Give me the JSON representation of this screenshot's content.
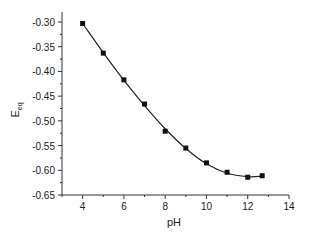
{
  "chart_data": {
    "type": "line",
    "title": "",
    "xlabel": "pH",
    "ylabel": "E",
    "ylabel_subscript": "eq",
    "xlim": [
      3,
      14
    ],
    "ylim": [
      -0.65,
      -0.28
    ],
    "xticks": [
      4,
      6,
      8,
      10,
      12,
      14
    ],
    "xtick_labels": [
      "4",
      "6",
      "8",
      "10",
      "12",
      "14"
    ],
    "yticks": [
      -0.3,
      -0.35,
      -0.4,
      -0.45,
      -0.5,
      -0.55,
      -0.6,
      -0.65
    ],
    "ytick_labels": [
      "-0.30",
      "-0.35",
      "-0.40",
      "-0.45",
      "-0.50",
      "-0.55",
      "-0.60",
      "-0.65"
    ],
    "grid": false,
    "legend": null,
    "series": [
      {
        "name": "E_eq measured",
        "style": "square markers",
        "color": "#111111",
        "x": [
          4,
          5,
          6,
          7,
          8,
          9,
          10,
          11,
          12,
          12.7
        ],
        "y": [
          -0.303,
          -0.363,
          -0.417,
          -0.466,
          -0.521,
          -0.555,
          -0.585,
          -0.604,
          -0.614,
          -0.611
        ]
      },
      {
        "name": "fit",
        "style": "smooth line",
        "color": "#222222",
        "x": [
          4,
          5,
          6,
          7,
          8,
          9,
          10,
          11,
          12,
          12.7
        ],
        "y": [
          -0.303,
          -0.362,
          -0.418,
          -0.469,
          -0.516,
          -0.556,
          -0.587,
          -0.606,
          -0.613,
          -0.612
        ]
      }
    ]
  }
}
